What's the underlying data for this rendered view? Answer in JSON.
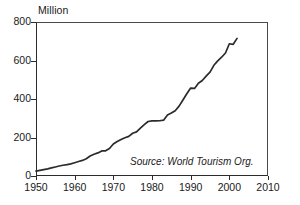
{
  "chart_data": {
    "type": "line",
    "title": "",
    "subtitle": "",
    "unit_label": "Million",
    "xlabel": "",
    "ylabel": "",
    "xlim": [
      1950,
      2010
    ],
    "ylim": [
      0,
      800
    ],
    "grid": false,
    "legend": null,
    "legend_position": "none",
    "annotations": [
      {
        "name": "source-note",
        "text": "Source: World Tourism Org.",
        "style": "italic",
        "x": 1988,
        "y": 95
      }
    ],
    "xticks": [
      1950,
      1960,
      1970,
      1980,
      1990,
      2000,
      2010
    ],
    "xtick_labels": [
      "1950",
      "1960",
      "1970",
      "1980",
      "1990",
      "2000",
      "2010"
    ],
    "yticks": [
      0,
      200,
      400,
      600,
      800
    ],
    "ytick_labels": [
      "0",
      "200",
      "400",
      "600",
      "800"
    ],
    "series": [
      {
        "name": "International tourist arrivals",
        "color": "#2b2b2b",
        "x": [
          1950,
          1951,
          1952,
          1953,
          1954,
          1955,
          1956,
          1957,
          1958,
          1959,
          1960,
          1961,
          1962,
          1963,
          1964,
          1965,
          1966,
          1967,
          1968,
          1969,
          1970,
          1971,
          1972,
          1973,
          1974,
          1975,
          1976,
          1977,
          1978,
          1979,
          1980,
          1981,
          1982,
          1983,
          1984,
          1985,
          1986,
          1987,
          1988,
          1989,
          1990,
          1991,
          1992,
          1993,
          1994,
          1995,
          1996,
          1997,
          1998,
          1999,
          2000,
          2001,
          2002
        ],
        "values": [
          25,
          29,
          33,
          37,
          42,
          47,
          52,
          56,
          59,
          63,
          69,
          75,
          81,
          90,
          104,
          113,
          120,
          130,
          131,
          143,
          166,
          179,
          190,
          199,
          206,
          222,
          229,
          249,
          267,
          283,
          286,
          286,
          287,
          290,
          317,
          327,
          339,
          363,
          395,
          427,
          457,
          455,
          482,
          496,
          519,
          540,
          575,
          598,
          617,
          639,
          687,
          684,
          715
        ]
      }
    ]
  }
}
